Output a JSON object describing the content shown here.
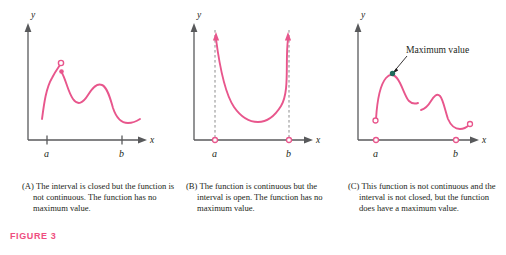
{
  "figure": {
    "label": "FIGURE 3",
    "label_color": "#ef4e80",
    "curve_color": "#e8568c",
    "axis_color": "#58595b",
    "dashed_color": "#8c8c8c",
    "max_dot_color": "#1f6b5c",
    "leader_color": "#231f20"
  },
  "panels": [
    {
      "id": "A",
      "name": "closed-interval-discontinuous",
      "axis": {
        "y_label": "y",
        "x_label": "x",
        "x_ticks": [
          {
            "label": "a",
            "marker": "tick"
          },
          {
            "label": "b",
            "marker": "tick"
          }
        ]
      },
      "annotations": [],
      "markers": [
        {
          "kind": "open-circle",
          "meaning": "removed-point-limit"
        },
        {
          "kind": "filled-dot",
          "meaning": "function-value-at-point"
        }
      ],
      "caption": {
        "tag": "(A)",
        "text": "The interval is closed but the function is not continuous. The function has no maximum value."
      }
    },
    {
      "id": "B",
      "name": "open-interval-continuous",
      "axis": {
        "y_label": "y",
        "x_label": "x",
        "x_ticks": [
          {
            "label": "a",
            "marker": "open-circle"
          },
          {
            "label": "b",
            "marker": "open-circle"
          }
        ]
      },
      "annotations": [],
      "markers": [
        {
          "kind": "dashed-vertical",
          "meaning": "interval-endpoint-a"
        },
        {
          "kind": "dashed-vertical",
          "meaning": "interval-endpoint-b"
        },
        {
          "kind": "arrowhead-up",
          "meaning": "curve-increases-without-bound"
        },
        {
          "kind": "arrowhead-up",
          "meaning": "curve-increases-without-bound"
        }
      ],
      "caption": {
        "tag": "(B)",
        "text": "The function is continuous but the interval is open. The function has no maximum value."
      }
    },
    {
      "id": "C",
      "name": "not-continuous-not-closed-has-maximum",
      "axis": {
        "y_label": "y",
        "x_label": "x",
        "x_ticks": [
          {
            "label": "a",
            "marker": "open-circle"
          },
          {
            "label": "b",
            "marker": "open-circle"
          }
        ]
      },
      "annotations": [
        {
          "text": "Maximum value",
          "target": "curve-peak"
        }
      ],
      "markers": [
        {
          "kind": "filled-dot",
          "meaning": "maximum-value-point"
        },
        {
          "kind": "open-circle",
          "meaning": "left-endpoint-excluded"
        },
        {
          "kind": "open-circle",
          "meaning": "right-endpoint-excluded"
        }
      ],
      "caption": {
        "tag": "(C)",
        "text": "This function is not continuous and the interval is not closed, but the function does have a maximum value."
      }
    }
  ]
}
